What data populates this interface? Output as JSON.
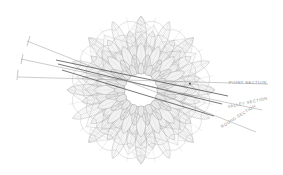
{
  "drawing": {
    "title": "Rosette Plan with Section Cuts",
    "background_color": "#ffffff",
    "ink_color": "#9a9a9a",
    "dark_ink_color": "#3d3d3d",
    "hatch_color": "#b4b4b4",
    "center_fill": "#ffffff",
    "rosette": {
      "center_x": 141,
      "center_y": 90,
      "outer_radius": 76,
      "petal_count": 16,
      "star_points": 16,
      "ring_count": 5,
      "center_polygon_radius": 17,
      "center_polygon_sides": 16
    }
  },
  "section_labels": [
    {
      "id": "point-section",
      "text": "POINT SECTION",
      "x": 229,
      "y": 84,
      "rotation": 0
    },
    {
      "id": "valley-section",
      "text": "VALLEY SECTION",
      "x": 228,
      "y": 108,
      "rotation": -12
    },
    {
      "id": "round-section",
      "text": "ROUND SECTION",
      "x": 222,
      "y": 128,
      "rotation": -32
    }
  ],
  "section_lines": [
    {
      "id": "point-section-line",
      "x1": 18,
      "y1": 77,
      "x2": 268,
      "y2": 84
    },
    {
      "id": "valley-section-line",
      "x1": 21,
      "y1": 59,
      "x2": 262,
      "y2": 110
    },
    {
      "id": "round-section-line",
      "x1": 27,
      "y1": 41,
      "x2": 256,
      "y2": 132
    }
  ],
  "leader_ticks": [
    {
      "id": "tick-upper",
      "x1": 30,
      "y1": 36,
      "x2": 27,
      "y2": 46
    },
    {
      "id": "tick-mid",
      "x1": 23,
      "y1": 54,
      "x2": 21,
      "y2": 64
    },
    {
      "id": "tick-lower",
      "x1": 18,
      "y1": 70,
      "x2": 17,
      "y2": 80
    }
  ],
  "cut_lines": [
    {
      "id": "cut-a",
      "x1": 56,
      "y1": 60,
      "x2": 228,
      "y2": 96
    },
    {
      "id": "cut-b",
      "x1": 58,
      "y1": 64,
      "x2": 222,
      "y2": 104
    },
    {
      "id": "cut-c",
      "x1": 62,
      "y1": 70,
      "x2": 214,
      "y2": 116
    }
  ]
}
